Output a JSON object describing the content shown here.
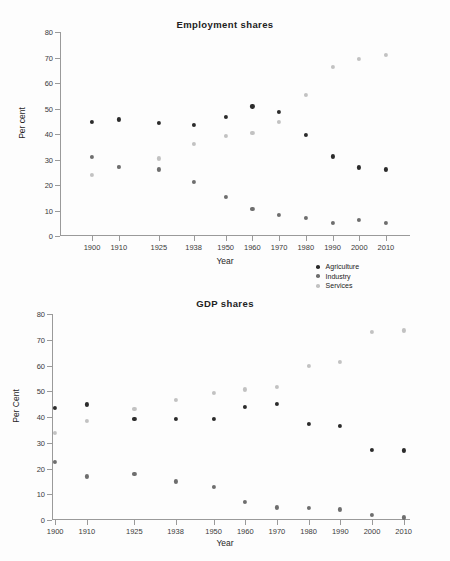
{
  "figure": {
    "width": 450,
    "height": 561,
    "background": "#fdfdfd"
  },
  "series_colors": {
    "Agriculture": "#2b2b2b",
    "Industry": "#6e6e6e",
    "Services": "#c2c2c2"
  },
  "legend": {
    "position": "below-first-panel-right",
    "entries": [
      {
        "label": "Agriculture",
        "color": "#2b2b2b"
      },
      {
        "label": "Industry",
        "color": "#6e6e6e"
      },
      {
        "label": "Services",
        "color": "#c2c2c2"
      }
    ]
  },
  "chart_data": [
    {
      "id": "employment",
      "type": "scatter",
      "title": "Employment shares",
      "xlabel": "Year",
      "ylabel": "Per cent",
      "categories": [
        "1900",
        "1910",
        "1925",
        "1938",
        "1950",
        "1960",
        "1970",
        "1980",
        "1990",
        "2000",
        "2010"
      ],
      "x": [
        1900,
        1910,
        1925,
        1938,
        1950,
        1960,
        1970,
        1980,
        1990,
        2000,
        2010
      ],
      "ylim": [
        0,
        80
      ],
      "yticks": [
        0,
        10,
        20,
        30,
        40,
        50,
        60,
        70,
        80
      ],
      "grid": false,
      "series": [
        {
          "name": "Agriculture",
          "color": "#2b2b2b",
          "values": [
            44.8,
            45.7,
            44.2,
            43.5,
            46.6,
            50.8,
            48.7,
            39.5,
            31.2,
            26.9,
            26.1
          ]
        },
        {
          "name": "Industry",
          "color": "#6e6e6e",
          "values": [
            31.1,
            27.2,
            26.1,
            21.3,
            15.2,
            10.7,
            8.4,
            7.0,
            5.0,
            6.3,
            5.2
          ]
        },
        {
          "name": "Services",
          "color": "#c2c2c2",
          "values": [
            24.1,
            27.2,
            30.4,
            36.1,
            39.4,
            40.4,
            44.6,
            55.4,
            66.3,
            69.4,
            71.1
          ]
        }
      ]
    },
    {
      "id": "gdp",
      "type": "scatter",
      "title": "GDP shares",
      "xlabel": "Year",
      "ylabel": "Per Cent",
      "categories": [
        "1900",
        "1910",
        "1925",
        "1938",
        "1950",
        "1960",
        "1970",
        "1980",
        "1990",
        "2000",
        "2010"
      ],
      "x": [
        1900,
        1910,
        1925,
        1938,
        1950,
        1960,
        1970,
        1980,
        1990,
        2000,
        2010
      ],
      "ylim": [
        0,
        80
      ],
      "yticks": [
        0,
        10,
        20,
        30,
        40,
        50,
        60,
        70,
        80
      ],
      "grid": false,
      "series": [
        {
          "name": "Agriculture",
          "color": "#2b2b2b",
          "values": [
            43.4,
            44.9,
            39.4,
            39.4,
            39.4,
            43.8,
            45.2,
            37.4,
            36.5,
            27.2,
            27.0
          ]
        },
        {
          "name": "Industry",
          "color": "#6e6e6e",
          "values": [
            22.7,
            16.9,
            18.0,
            15.0,
            12.8,
            7.1,
            4.9,
            4.6,
            4.1,
            1.9,
            1.0
          ]
        },
        {
          "name": "Services",
          "color": "#c2c2c2",
          "values": [
            33.9,
            38.4,
            43.2,
            46.6,
            49.2,
            50.7,
            51.7,
            59.8,
            61.5,
            73.0,
            73.6
          ]
        }
      ]
    }
  ]
}
